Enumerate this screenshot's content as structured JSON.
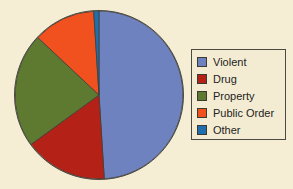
{
  "figure": {
    "background_color": "#f5eed4"
  },
  "legend": {
    "position": "right",
    "border_color": "#4a4a42",
    "background_color": "#f3ecd2",
    "entries": [
      {
        "label": "Violent",
        "color": "#6f82c0"
      },
      {
        "label": "Drug",
        "color": "#b42116"
      },
      {
        "label": "Property",
        "color": "#5e7a31"
      },
      {
        "label": "Public Order",
        "color": "#f0511e"
      },
      {
        "label": "Other",
        "color": "#1f6fae"
      }
    ]
  },
  "chart_data": {
    "type": "pie",
    "title": "",
    "xlabel": "",
    "ylabel": "",
    "grid": false,
    "legend_position": "right",
    "start_angle_deg": 90,
    "direction": "clockwise",
    "categories": [
      "Violent",
      "Drug",
      "Property",
      "Public Order",
      "Other"
    ],
    "values": [
      49,
      16,
      22,
      12,
      1
    ],
    "units": "percent",
    "colors": [
      "#6f82c0",
      "#b42116",
      "#5e7a31",
      "#f0511e",
      "#1f6fae"
    ],
    "slices": [
      {
        "label": "Violent",
        "value": 49,
        "color": "#6f82c0",
        "start_deg": 1,
        "end_deg": 177
      },
      {
        "label": "Drug",
        "value": 16,
        "color": "#b42116",
        "start_deg": 177,
        "end_deg": 235
      },
      {
        "label": "Property",
        "value": 22,
        "color": "#5e7a31",
        "start_deg": 235,
        "end_deg": 314
      },
      {
        "label": "Public Order",
        "value": 12,
        "color": "#f0511e",
        "start_deg": 314,
        "end_deg": 357
      },
      {
        "label": "Other",
        "value": 1,
        "color": "#1f6fae",
        "start_deg": 357,
        "end_deg": 361
      }
    ]
  }
}
